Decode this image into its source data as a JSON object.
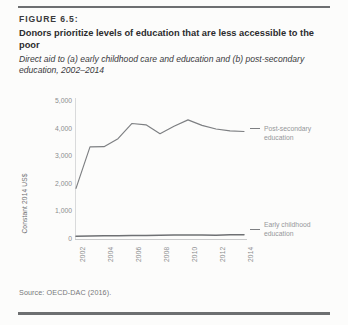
{
  "figure": {
    "number": "FIGURE 6.5:",
    "title": "Donors prioritize levels of education that are less accessible to the poor",
    "subtitle": "Direct aid to (a) early childhood care and education and (b) post-secondary education, 2002–2014",
    "source": "Source: OECD-DAC (2016)."
  },
  "legend": {
    "post_secondary": "Post-secondary education",
    "early_childhood": "Early childhood education"
  },
  "colors": {
    "line": "#7d7f82",
    "axis": "#d9dadb",
    "tick_text": "#8b8d8f",
    "title_text": "#2c2c2e",
    "rule": "#6d6f71",
    "background": "#fcfcfb"
  },
  "chart_data": {
    "type": "line",
    "title": "Donors prioritize levels of education that are less accessible to the poor",
    "subtitle": "Direct aid to (a) early childhood care and education and (b) post-secondary education, 2002–2014",
    "xlabel": "",
    "ylabel": "Constant 2014 US$",
    "x": [
      2002,
      2003,
      2004,
      2005,
      2006,
      2007,
      2008,
      2009,
      2010,
      2011,
      2012,
      2013,
      2014
    ],
    "xticks": [
      "2002",
      "2004",
      "2006",
      "2008",
      "2010",
      "2012",
      "2014"
    ],
    "yticks": [
      "0",
      "1,000",
      "2,000",
      "3,000",
      "4,000",
      "5,000"
    ],
    "ytick_values": [
      0,
      1000,
      2000,
      3000,
      4000,
      5000
    ],
    "ylim": [
      0,
      5000
    ],
    "xlim": [
      2002,
      2014
    ],
    "grid": false,
    "legend_position": "right",
    "series": [
      {
        "name": "Post-secondary education",
        "values": [
          1800,
          3300,
          3310,
          3600,
          4150,
          4100,
          3780,
          4050,
          4280,
          4080,
          3950,
          3880,
          3860
        ]
      },
      {
        "name": "Early childhood education",
        "values": [
          60,
          70,
          80,
          85,
          90,
          95,
          100,
          105,
          110,
          105,
          100,
          115,
          120
        ]
      }
    ]
  }
}
